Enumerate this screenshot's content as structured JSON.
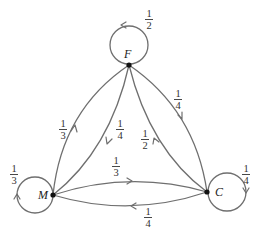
{
  "diagram": {
    "type": "markov-transition-graph",
    "nodes": [
      {
        "id": "F",
        "label": "F",
        "self_loop": "1/2"
      },
      {
        "id": "M",
        "label": "M",
        "self_loop": "1/3"
      },
      {
        "id": "C",
        "label": "C",
        "self_loop": "1/4"
      }
    ],
    "edges": [
      {
        "from": "M",
        "to": "F",
        "label": "1/3"
      },
      {
        "from": "F",
        "to": "M",
        "label": "1/4"
      },
      {
        "from": "F",
        "to": "C",
        "label": "1/4"
      },
      {
        "from": "C",
        "to": "F",
        "label": "1/2"
      },
      {
        "from": "M",
        "to": "C",
        "label": "1/3"
      },
      {
        "from": "C",
        "to": "M",
        "label": "1/4"
      }
    ],
    "labels": {
      "F": "F",
      "M": "M",
      "C": "C",
      "loopF_num": "1",
      "loopF_den": "2",
      "loopM_num": "1",
      "loopM_den": "3",
      "loopC_num": "1",
      "loopC_den": "4",
      "MF_num": "1",
      "MF_den": "3",
      "FM_num": "1",
      "FM_den": "4",
      "FC_num": "1",
      "FC_den": "4",
      "CF_num": "1",
      "CF_den": "2",
      "MC_num": "1",
      "MC_den": "3",
      "CM_num": "1",
      "CM_den": "4"
    }
  }
}
